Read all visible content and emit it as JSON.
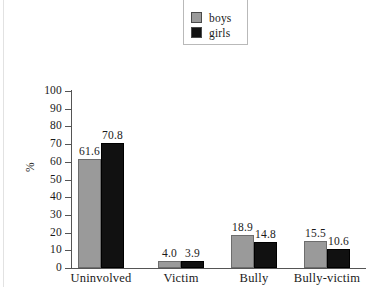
{
  "chart_data": {
    "type": "bar",
    "title": "",
    "xlabel": "",
    "ylabel": "%",
    "ylim": [
      0,
      100
    ],
    "ytick_step": 10,
    "yticks": [
      "100",
      "90",
      "80",
      "70",
      "60",
      "50",
      "40",
      "30",
      "20",
      "10",
      "0"
    ],
    "grid": false,
    "legend_position": "top-right",
    "categories": [
      "Uninvolved",
      "Victim",
      "Bully",
      "Bully-victim"
    ],
    "series": [
      {
        "name": "boys",
        "color": "#9a9a9a",
        "values": [
          61.6,
          4.0,
          18.9,
          15.5
        ],
        "labels": [
          "61.6",
          "4.0",
          "18.9",
          "15.5"
        ]
      },
      {
        "name": "girls",
        "color": "#111111",
        "values": [
          70.8,
          3.9,
          14.8,
          10.6
        ],
        "labels": [
          "70.8",
          "3.9",
          "14.8",
          "10.6"
        ]
      }
    ]
  },
  "legend": {
    "items": [
      {
        "label": "boys",
        "swatch": "legend-swatch-boys"
      },
      {
        "label": "girls",
        "swatch": "legend-swatch-girls"
      }
    ]
  },
  "axis": {
    "y_title": "%"
  }
}
